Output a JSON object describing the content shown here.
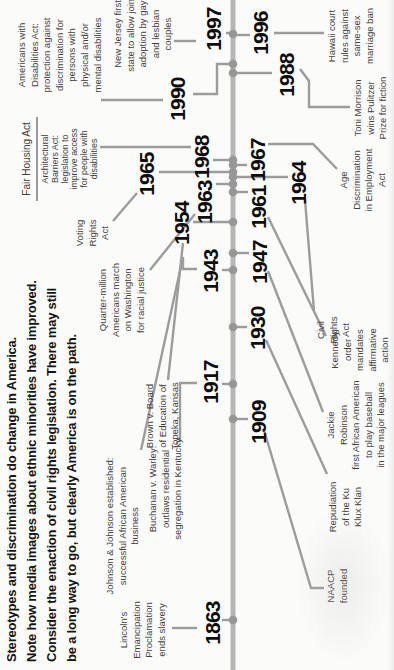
{
  "header": {
    "lines": [
      "Stereotypes and discrimination do change in America.",
      "Note how media images about ethnic minorities have improved.",
      "Consider the enaction of civil rights legislation.  There may still",
      "be a long way to go, but clearly America is on the path."
    ]
  },
  "palette": {
    "background": "#fbfbfa",
    "axis": "#b6b6b6",
    "line": "#9c9c9c",
    "dot": "#979797",
    "rule": "#6f6f6f",
    "year_text": "#0d0d0d",
    "label_text": "#3e3e3e",
    "header_text": "#151515"
  },
  "timeline": {
    "orientation": "rotated-90-ccw",
    "axis": {
      "y": 233,
      "x1": 0,
      "x2": 670,
      "thickness": 5
    },
    "dots": [
      50,
      251,
      286,
      343,
      400,
      417,
      448,
      478,
      486,
      493,
      498,
      505,
      510,
      597,
      606,
      636
    ],
    "rules": [
      [
        469,
        37,
        553,
        37
      ]
    ],
    "years": [
      {
        "text": "1863",
        "side": "above",
        "x": 47,
        "y": 213,
        "tick": [
          50,
          222,
          233
        ]
      },
      {
        "text": "1917",
        "side": "above",
        "x": 288,
        "y": 211,
        "tick": [
          286,
          222,
          233
        ]
      },
      {
        "text": "1943",
        "side": "above",
        "x": 399,
        "y": 211,
        "tick": [
          400,
          222,
          233
        ]
      },
      {
        "text": "1954",
        "side": "above",
        "x": 447,
        "y": 182,
        "tick": [
          448,
          193,
          233
        ]
      },
      {
        "text": "1963",
        "side": "above",
        "x": 468,
        "y": 205,
        "tick": [
          486,
          216,
          233
        ]
      },
      {
        "text": "1965",
        "side": "above",
        "x": 496,
        "y": 147,
        "tick": [
          498,
          159,
          233
        ]
      },
      {
        "text": "1968",
        "side": "above",
        "x": 513,
        "y": 202,
        "tick": [
          510,
          213,
          233
        ]
      },
      {
        "text": "1990",
        "side": "above",
        "x": 571,
        "y": 178,
        "elbow": [
          [
            576,
            193
          ],
          [
            576,
            217
          ],
          [
            606,
            217
          ],
          [
            606,
            231
          ]
        ]
      },
      {
        "text": "1997",
        "side": "above",
        "x": 641,
        "y": 214,
        "tick": [
          637,
          226,
          233
        ]
      },
      {
        "text": "1909",
        "side": "below",
        "x": 248,
        "y": 259,
        "tick": [
          251,
          233,
          248
        ]
      },
      {
        "text": "1930",
        "side": "below",
        "x": 342,
        "y": 258,
        "tick": [
          343,
          233,
          247
        ]
      },
      {
        "text": "1947",
        "side": "below",
        "x": 408,
        "y": 260,
        "tick": [
          417,
          233,
          249
        ]
      },
      {
        "text": "1961",
        "side": "below",
        "x": 463,
        "y": 259,
        "tick": [
          478,
          233,
          248
        ]
      },
      {
        "text": "1964",
        "side": "below",
        "x": 487,
        "y": 299,
        "tick": [
          493,
          233,
          288
        ]
      },
      {
        "text": "1967",
        "side": "below",
        "x": 510,
        "y": 258,
        "tick": [
          505,
          233,
          247
        ]
      },
      {
        "text": "1988",
        "side": "below",
        "x": 595,
        "y": 287,
        "tick": [
          597,
          233,
          272
        ]
      },
      {
        "text": "1996",
        "side": "below",
        "x": 637,
        "y": 261,
        "tick": [
          635,
          233,
          250
        ]
      }
    ],
    "labels": [
      {
        "id": "lincoln",
        "year": "1863",
        "text": "Lincoln's\nEmancipation\nProclamation\nends slavery",
        "cx": 40,
        "top": 118,
        "w": 80,
        "connector": [
          [
            42,
            172
          ],
          [
            42,
            197
          ]
        ]
      },
      {
        "id": "jj",
        "year": "1943",
        "text": "Johnson & Johnson established:\nsuccessful African American\nbusiness",
        "cx": 144,
        "top": 104,
        "w": 152,
        "connector": [
          [
            220,
            141
          ],
          [
            413,
            183
          ],
          [
            401,
            183
          ],
          [
            401,
            197
          ]
        ]
      },
      {
        "id": "buchanan",
        "year": "1917",
        "text": "Buchanan v. Warley:\noutlaws residential\nsegregation in Kentucky",
        "cx": 181,
        "top": 147,
        "w": 110,
        "connector": [
          [
            228,
            180
          ],
          [
            287,
            180
          ],
          [
            287,
            197
          ]
        ]
      },
      {
        "id": "brown",
        "year": "1954",
        "text": "Brown v. Board\nof Education of\nTopeka, Kansas",
        "cx": 254,
        "top": 144,
        "w": 86,
        "connector": [
          [
            290,
            168
          ],
          [
            427,
            183
          ]
        ]
      },
      {
        "id": "march",
        "year": "1963",
        "text": "Quarter-million\nAmericans march\non Washington\nfor racial justice",
        "cx": 370,
        "top": 97,
        "w": 95,
        "connector": [
          [
            400,
            150
          ],
          [
            456,
            195
          ]
        ]
      },
      {
        "id": "vra",
        "year": "1965",
        "text": "Voting\nRights\nAct",
        "cx": 437,
        "top": 74,
        "w": 45,
        "connector": [
          [
            449,
            113
          ],
          [
            477,
            137
          ]
        ]
      },
      {
        "id": "fha",
        "year": "1968",
        "text": "Fair Housing Act",
        "cx": 511,
        "top": 20,
        "w": 92,
        "style": "single",
        "connector": [
          [
            523,
            100
          ],
          [
            523,
            191
          ]
        ]
      },
      {
        "id": "aba",
        "year": "1968",
        "text": "Architectural\nBarriers Act:\nlegislation to\nimprove access\nfor people with\ndisabilities",
        "cx": 511,
        "top": 41,
        "w": 82,
        "style": "small"
      },
      {
        "id": "ada",
        "year": "1990",
        "text": "Americans with\nDisabilities Act:\nprotection against\ndiscrimination for\npersons with\nphysical and/or\nmental disabilities",
        "cx": 615,
        "top": 16,
        "w": 97,
        "connector": [
          [
            570,
            101
          ],
          [
            570,
            163
          ]
        ]
      },
      {
        "id": "nj",
        "year": "1997",
        "text": "New Jersey first\nstate to allow joint\nadoption by gay\nand lesbian\ncouples",
        "cx": 636,
        "top": 112,
        "w": 95,
        "connector": [
          [
            629,
            174
          ],
          [
            629,
            196
          ]
        ]
      },
      {
        "id": "naacp",
        "year": "1909",
        "text": "NAACP\nfounded",
        "cx": 84,
        "top": 325,
        "w": 55,
        "connector": [
          [
            82,
            324
          ],
          [
            82,
            311
          ],
          [
            240,
            264
          ]
        ]
      },
      {
        "id": "kkk",
        "year": "1930",
        "text": "Repudiation\nof the Ku\nKlux Klan",
        "cx": 163,
        "top": 327,
        "w": 70,
        "connector": [
          [
            196,
            327
          ],
          [
            330,
            266
          ]
        ]
      },
      {
        "id": "jackie",
        "year": "1947",
        "text": "Jackie\nRobinson\nfirst African American\nto play baseball\nin the major leagues",
        "cx": 245,
        "top": 325,
        "w": 112,
        "connector": [
          [
            258,
            323
          ],
          [
            399,
            268
          ]
        ]
      },
      {
        "id": "kennedy",
        "year": "1961",
        "text": "Kennedy\norder\nmandates\naffirmative\naction",
        "cx": 320,
        "top": 329,
        "w": 62,
        "connector": [
          [
            334,
            326
          ],
          [
            453,
            268
          ]
        ]
      },
      {
        "id": "cra",
        "year": "1964",
        "text": "Civil\nRights\nAct",
        "cx": 340,
        "top": 315,
        "w": 40,
        "connector": [
          [
            359,
            314
          ],
          [
            470,
            305
          ]
        ]
      },
      {
        "id": "age",
        "year": "1967",
        "text": "Age\nDiscrimination\nin Employment\nAct",
        "cx": 490,
        "top": 338,
        "w": 86,
        "connector": [
          [
            501,
            337
          ],
          [
            526,
            313
          ],
          [
            526,
            268
          ]
        ]
      },
      {
        "id": "toni",
        "year": "1988",
        "text": "Toni Morrison\nwins Pulitzer\nPrize for fiction",
        "cx": 562,
        "top": 352,
        "w": 82,
        "connector": [
          [
            601,
            300
          ],
          [
            589,
            309
          ],
          [
            563,
            309
          ],
          [
            563,
            350
          ]
        ]
      },
      {
        "id": "hawaii",
        "year": "1996",
        "text": "Hawaii court\nrules against\nsame-sex\nmarriage ban",
        "cx": 634,
        "top": 326,
        "w": 74,
        "connector": [
          [
            637,
            274
          ],
          [
            637,
            324
          ]
        ]
      }
    ]
  }
}
